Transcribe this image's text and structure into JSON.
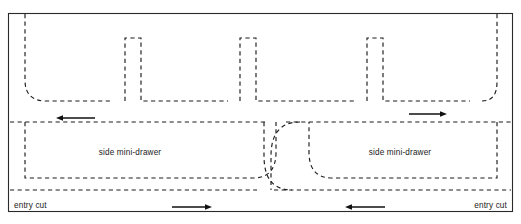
{
  "diagram": {
    "canvas": {
      "width": 521,
      "height": 224
    },
    "colors": {
      "background": "#ffffff",
      "frame_stroke": "#2a2a2a",
      "cut_stroke": "#1c1c1c",
      "arrow": "#111111",
      "text": "#1a1a1a"
    },
    "frame": {
      "x": 8,
      "y": 13,
      "width": 505,
      "height": 199
    },
    "labels": {
      "drawer_left": "side mini-drawer",
      "drawer_right": "side mini-drawer",
      "entry_cut_left": "entry cut",
      "entry_cut_right": "entry cut"
    },
    "label_positions": {
      "drawer_left": {
        "x": 130,
        "y": 155
      },
      "drawer_right": {
        "x": 400,
        "y": 155
      },
      "entry_cut_left": {
        "x": 14,
        "y": 208
      },
      "entry_cut_right": {
        "x": 507,
        "y": 208
      }
    },
    "arrows": [
      {
        "name": "arrow-top-left",
        "direction": "left",
        "x1": 95,
        "x2": 56,
        "y": 118
      },
      {
        "name": "arrow-top-right",
        "direction": "right",
        "x1": 409,
        "x2": 447,
        "y": 114
      },
      {
        "name": "arrow-bottom-left",
        "direction": "right",
        "x1": 172,
        "x2": 212,
        "y": 207
      },
      {
        "name": "arrow-bottom-right",
        "direction": "left",
        "x1": 385,
        "x2": 345,
        "y": 207
      }
    ],
    "cut_paths": {
      "upper_band": [
        "M 25 18 L 25 80 Q 25 101 46 101 L 113 101",
        "M 125 101 L 125 36 L 141 36 L 141 101 L 228 101",
        "M 240 101 L 240 36 L 256 36 L 256 101 L 355 101",
        "M 367 101 L 367 36 L 383 36 L 383 101 L 470 101",
        "M 482 101 Q 497 101 497 82 L 497 18"
      ],
      "mid_line_left": "M 10 122 L 268 122",
      "mid_line_right": "M 284 122 L 511 122",
      "bottom_line_left": "M 10 190 L 255 190",
      "bottom_line_right": "M 272 190 L 511 190",
      "left_drawer_outline": "M 25 122 L 25 178 L 255 178 Q 276 178 276 156 L 276 122",
      "left_drawer_inner": "M 264 122 L 264 156 Q 264 190 290 190",
      "right_drawer_outline": "M 497 122 L 497 178 L 330 178 Q 309 178 309 156 L 309 122",
      "right_drawer_inner": "M 297 122 Q 271 122 271 156 L 271 190"
    }
  }
}
